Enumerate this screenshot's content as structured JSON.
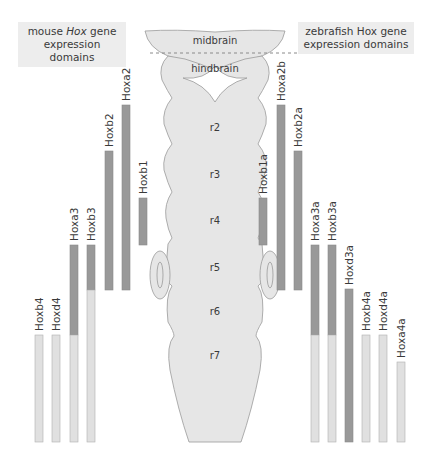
{
  "titles": {
    "mouse": {
      "prefix": "mouse ",
      "italic": "Hox",
      "suffix": " gene",
      "line2": "expression domains"
    },
    "zebrafish": {
      "prefix": "zebrafish ",
      "italic": "Hox",
      "suffix": " gene",
      "line2": "expression domains"
    }
  },
  "brain": {
    "regions": [
      "midbrain",
      "hindbrain"
    ],
    "rhombomeres": [
      "r2",
      "r3",
      "r4",
      "r5",
      "r6",
      "r7"
    ]
  },
  "colors": {
    "dark_bar": "#999999",
    "light_bar": "#e0e0e0",
    "bar_border": "#8a8a8a",
    "brain_fill": "#e6e6e6",
    "brain_stroke": "#9a9a9a",
    "title_bg": "#ededed"
  },
  "chart_data": {
    "type": "diagram",
    "mouse_genes": [
      {
        "name": "Hoxb4",
        "anterior": "r7",
        "strong_from": null,
        "light_from": "r7"
      },
      {
        "name": "Hoxd4",
        "anterior": "r7",
        "strong_from": null,
        "light_from": "r7"
      },
      {
        "name": "Hoxa3",
        "anterior": "r5",
        "strong_from": "r5",
        "light_from": "r7"
      },
      {
        "name": "Hoxb3",
        "anterior": "r5",
        "strong_from": "r5",
        "light_from": "r6"
      },
      {
        "name": "Hoxb2",
        "anterior": "r3",
        "strong_from": "r3",
        "light_from": null
      },
      {
        "name": "Hoxa2",
        "anterior": "r2",
        "strong_from": "r2",
        "light_from": null
      },
      {
        "name": "Hoxb1",
        "anterior": "r4",
        "strong_from": "r4",
        "light_from": null,
        "posterior": "r4"
      }
    ],
    "zebrafish_genes": [
      {
        "name": "Hoxb1a",
        "anterior": "r4",
        "strong_from": "r4",
        "light_from": null,
        "posterior": "r4"
      },
      {
        "name": "Hoxa2b",
        "anterior": "r2",
        "strong_from": "r2",
        "light_from": null
      },
      {
        "name": "Hoxb2a",
        "anterior": "r3",
        "strong_from": "r3",
        "light_from": null
      },
      {
        "name": "Hoxa3a",
        "anterior": "r5",
        "strong_from": "r5",
        "light_from": "r7"
      },
      {
        "name": "Hoxb3a",
        "anterior": "r5",
        "strong_from": "r5",
        "light_from": "r7"
      },
      {
        "name": "Hoxd3a",
        "anterior": "r6",
        "strong_from": "r6",
        "light_from": null
      },
      {
        "name": "Hoxb4a",
        "anterior": "r7",
        "strong_from": null,
        "light_from": "r7"
      },
      {
        "name": "Hoxd4a",
        "anterior": "r7",
        "strong_from": null,
        "light_from": "r7"
      },
      {
        "name": "Hoxa4a",
        "anterior": "r7",
        "strong_from": null,
        "light_from": "r7"
      }
    ]
  },
  "bars": {
    "mouse": [
      {
        "label": "Hoxb4",
        "x": 39,
        "top": 335,
        "dark_end": 335,
        "bottom": 442
      },
      {
        "label": "Hoxd4",
        "x": 56,
        "top": 335,
        "dark_end": 335,
        "bottom": 442
      },
      {
        "label": "Hoxa3",
        "x": 74,
        "top": 245,
        "dark_end": 335,
        "bottom": 442
      },
      {
        "label": "Hoxb3",
        "x": 91,
        "top": 245,
        "dark_end": 290,
        "bottom": 442
      },
      {
        "label": "Hoxb2",
        "x": 109,
        "top": 151,
        "dark_end": 290,
        "bottom": 290
      },
      {
        "label": "Hoxa2",
        "x": 126,
        "top": 105,
        "dark_end": 290,
        "bottom": 290
      },
      {
        "label": "Hoxb1",
        "x": 143,
        "top": 198,
        "dark_end": 245,
        "bottom": 245
      }
    ],
    "zebrafish": [
      {
        "label": "Hoxb1a",
        "x": 263,
        "top": 198,
        "dark_end": 245,
        "bottom": 245
      },
      {
        "label": "Hoxa2b",
        "x": 281,
        "top": 105,
        "dark_end": 290,
        "bottom": 290
      },
      {
        "label": "Hoxb2a",
        "x": 298,
        "top": 151,
        "dark_end": 290,
        "bottom": 290
      },
      {
        "label": "Hoxa3a",
        "x": 315,
        "top": 245,
        "dark_end": 335,
        "bottom": 442
      },
      {
        "label": "Hoxb3a",
        "x": 332,
        "top": 245,
        "dark_end": 335,
        "bottom": 442
      },
      {
        "label": "Hoxd3a",
        "x": 349,
        "top": 289,
        "dark_end": 442,
        "bottom": 442
      },
      {
        "label": "Hoxb4a",
        "x": 366,
        "top": 335,
        "dark_end": 335,
        "bottom": 442
      },
      {
        "label": "Hoxd4a",
        "x": 383,
        "top": 335,
        "dark_end": 335,
        "bottom": 442
      },
      {
        "label": "Hoxa4a",
        "x": 401,
        "top": 362,
        "dark_end": 362,
        "bottom": 442
      }
    ]
  }
}
